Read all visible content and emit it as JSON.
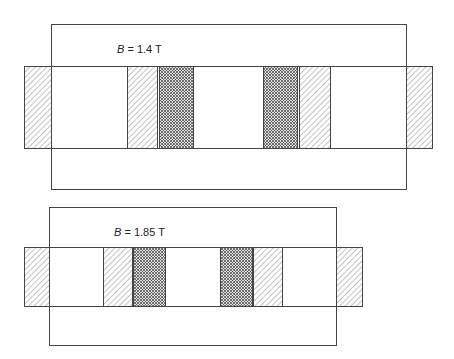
{
  "diagrams": [
    {
      "field_symbol": "B",
      "field_rest": " = 1.4 T",
      "outer_box": {
        "x": 51,
        "y": 24,
        "w": 355,
        "h": 165
      },
      "strip": {
        "x": 24,
        "y": 66,
        "w": 408,
        "h": 82
      },
      "blocks": [
        {
          "type": "hatch",
          "x": 24,
          "w": 27
        },
        {
          "type": "hatch",
          "x": 127,
          "w": 30
        },
        {
          "type": "crosshatch",
          "x": 159,
          "w": 34
        },
        {
          "type": "crosshatch",
          "x": 263,
          "w": 34
        },
        {
          "type": "hatch",
          "x": 299,
          "w": 31
        },
        {
          "type": "hatch",
          "x": 406,
          "w": 26
        }
      ],
      "label_pos": {
        "x": 117,
        "y": 43
      }
    },
    {
      "field_symbol": "B",
      "field_rest": " = 1.85 T",
      "outer_box": {
        "x": 49,
        "y": 207,
        "w": 287,
        "h": 138
      },
      "strip": {
        "x": 24,
        "y": 247,
        "w": 338,
        "h": 59
      },
      "blocks": [
        {
          "type": "hatch",
          "x": 24,
          "w": 25
        },
        {
          "type": "hatch",
          "x": 103,
          "w": 29
        },
        {
          "type": "crosshatch",
          "x": 133,
          "w": 32
        },
        {
          "type": "crosshatch",
          "x": 220,
          "w": 32
        },
        {
          "type": "hatch",
          "x": 253,
          "w": 29
        },
        {
          "type": "hatch",
          "x": 336,
          "w": 26
        }
      ],
      "label_pos": {
        "x": 114,
        "y": 226
      }
    }
  ]
}
